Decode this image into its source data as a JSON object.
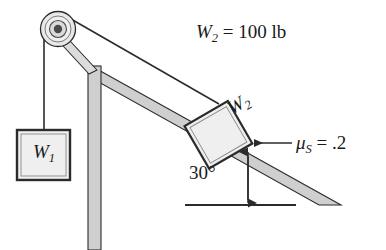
{
  "figure": {
    "labels": {
      "w2_value": "W",
      "w2_value_sub": "2",
      "w2_value_rest": " = 100 lb",
      "mu_symbol": "μ",
      "mu_sub": "S",
      "mu_rest": " = .2",
      "angle": "30°",
      "block1": "W",
      "block1_sub": "1",
      "block2": "W",
      "block2_sub": "2"
    },
    "colors": {
      "stroke": "#2b2b2b",
      "ramp_fill": "#c9c9c9",
      "ramp_fill_light": "#d8d8d8",
      "block_fill": "#efefef",
      "pulley_fill": "#e2e2e2",
      "hub_fill": "#4a4a4a",
      "background": "#ffffff",
      "text": "#1a1a1a"
    },
    "geometry": {
      "incline_angle_deg": 30,
      "pulley_center": [
        58,
        29
      ],
      "pulley_radius": 17,
      "contact_point": [
        248,
        146
      ],
      "apex": [
        95,
        68
      ],
      "ramp_toe": [
        341,
        205
      ]
    }
  }
}
